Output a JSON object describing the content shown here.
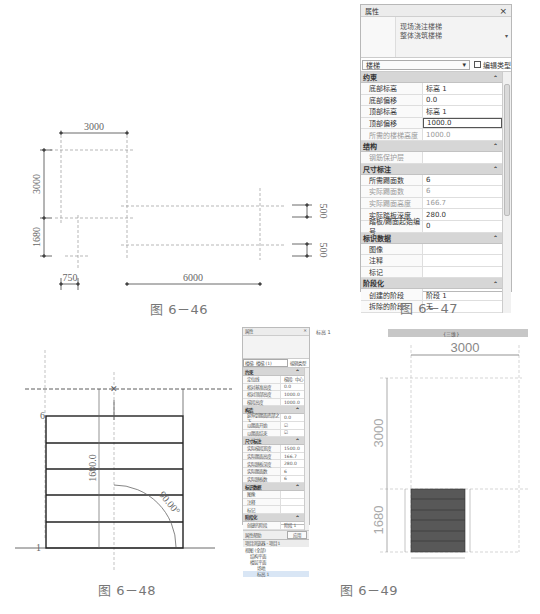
{
  "figures": {
    "fig46": {
      "caption": "图 6－46",
      "dimensions": {
        "top_width": "3000",
        "left_upper_height": "3000",
        "left_lower_height": "1680",
        "bottom_left_width": "750",
        "bottom_right_width": "6000",
        "right_upper_gap": "500",
        "right_lower_gap": "500"
      }
    },
    "fig47": {
      "caption": "图 6－47",
      "panel": {
        "title": "属性",
        "close": "×",
        "type_line1": "现场浇注楼梯",
        "type_line2": "整体浇筑楼梯",
        "dropdown": "楼梯",
        "edit_type": "编辑类型",
        "sections": [
          {
            "name": "约束",
            "rows": [
              {
                "k": "底部标高",
                "v": "标高 1"
              },
              {
                "k": "底部偏移",
                "v": "0.0"
              },
              {
                "k": "顶部标高",
                "v": "标高 1"
              },
              {
                "k": "顶部偏移",
                "v": "1000.0",
                "focused": true
              },
              {
                "k": "所需的楼梯高度",
                "v": "1000.0",
                "grey": true
              }
            ]
          },
          {
            "name": "结构",
            "rows": [
              {
                "k": "钢筋保护层",
                "v": "",
                "grey": true
              }
            ]
          },
          {
            "name": "尺寸标注",
            "rows": [
              {
                "k": "所需踢面数",
                "v": "6"
              },
              {
                "k": "实际踢面数",
                "v": "6",
                "grey": true
              },
              {
                "k": "实际踢面高度",
                "v": "166.7",
                "grey": true
              },
              {
                "k": "实际踏板深度",
                "v": "280.0"
              },
              {
                "k": "踏板/踢面起始编号",
                "v": "0"
              }
            ]
          },
          {
            "name": "标识数据",
            "rows": [
              {
                "k": "图像",
                "v": ""
              },
              {
                "k": "注释",
                "v": ""
              },
              {
                "k": "标记",
                "v": ""
              }
            ]
          },
          {
            "name": "阶段化",
            "rows": [
              {
                "k": "创建的阶段",
                "v": "阶段 1"
              },
              {
                "k": "拆除的阶段",
                "v": "无"
              }
            ]
          }
        ]
      }
    },
    "fig48": {
      "caption": "图 6－48",
      "label_top": "6",
      "label_bottom": "1",
      "height_dim": "1680.0",
      "angle": "90.00°"
    },
    "fig49": {
      "caption": "图 6－49",
      "panel": {
        "title": "属性",
        "dropdown": "楼梯: 楼梯 (1)",
        "edit_type": "编辑类型",
        "sections": [
          {
            "name": "约束",
            "rows": [
              {
                "k": "定位线",
                "v": "梯段: 中心"
              },
              {
                "k": "相对基准高度",
                "v": "0.0"
              },
              {
                "k": "相对顶部高度",
                "v": "1000.0"
              },
              {
                "k": "梯段高度",
                "v": "1000.0"
              }
            ]
          },
          {
            "name": "构造",
            "rows": [
              {
                "k": "延伸到踢面底部之下",
                "v": "0.0"
              },
              {
                "k": "以踢面开始",
                "v": "☑"
              },
              {
                "k": "以踢面结束",
                "v": "☑"
              }
            ]
          },
          {
            "name": "尺寸标注",
            "rows": [
              {
                "k": "实际梯段宽度",
                "v": "1500.0"
              },
              {
                "k": "实际踢面高度",
                "v": "166.7"
              },
              {
                "k": "实际踏板深度",
                "v": "280.0"
              },
              {
                "k": "实际踢面数",
                "v": "6"
              },
              {
                "k": "实际踏板数",
                "v": "6"
              }
            ]
          },
          {
            "name": "标识数据",
            "rows": [
              {
                "k": "图像",
                "v": ""
              },
              {
                "k": "注释",
                "v": ""
              },
              {
                "k": "标记",
                "v": ""
              }
            ]
          },
          {
            "name": "阶段化",
            "rows": [
              {
                "k": "创建的阶段",
                "v": "阶段 1"
              }
            ]
          }
        ],
        "help_link": "属性帮助",
        "apply": "应用"
      },
      "browser": {
        "title": "项目浏览器 - 项目1",
        "items": [
          "视图 (全部)",
          "结构平面",
          "楼层平面",
          "场地",
          "标高 1"
        ]
      },
      "tabs": [
        "标高 1",
        "{三维}"
      ],
      "dimensions": {
        "top": "3000",
        "upper": "3000",
        "lower": "1680"
      }
    }
  }
}
